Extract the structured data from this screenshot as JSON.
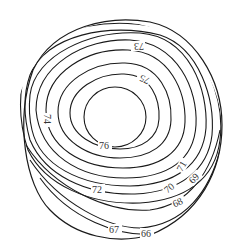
{
  "diagram": {
    "type": "contour-map",
    "boundary": "circular disk",
    "contour_labels": {
      "c76": "76",
      "c75": "75",
      "c74": "74",
      "c73": "73",
      "c72": "72",
      "c71": "71",
      "c70": "70",
      "c69": "69",
      "c68": "68",
      "c67": "67",
      "c66": "66"
    },
    "line_color": "#1a1a1a",
    "background": "#ffffff"
  }
}
